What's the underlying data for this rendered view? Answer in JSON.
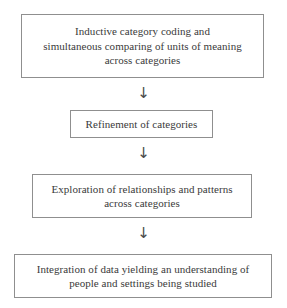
{
  "diagram": {
    "orientation": "vertical-top-down",
    "background_color": "#ffffff",
    "border_color": "#8f8f8f",
    "text_color": "#3a3a3a",
    "nodes": [
      {
        "id": "node-1",
        "lines": [
          "Inductive category coding and",
          "simultaneous comparing of units of meaning",
          "across categories"
        ]
      },
      {
        "id": "node-2",
        "lines": [
          "Refinement of categories"
        ]
      },
      {
        "id": "node-3",
        "lines": [
          "Exploration of relationships and patterns",
          "across categories"
        ]
      },
      {
        "id": "node-4",
        "lines": [
          "Integration of data yielding an understanding of",
          "people and settings being studied"
        ]
      }
    ],
    "connectors": [
      {
        "id": "connector-1",
        "glyph": "↓",
        "icon": "arrow-down-icon",
        "from": "node-1",
        "to": "node-2"
      },
      {
        "id": "connector-2",
        "glyph": "↓",
        "icon": "arrow-down-icon",
        "from": "node-2",
        "to": "node-3"
      },
      {
        "id": "connector-3",
        "glyph": "↓",
        "icon": "arrow-down-icon",
        "from": "node-3",
        "to": "node-4"
      }
    ]
  }
}
